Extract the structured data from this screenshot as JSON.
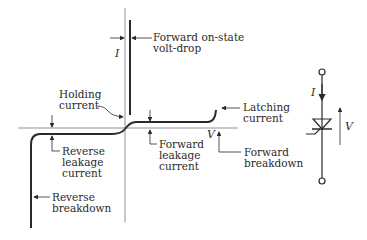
{
  "diagram": {
    "axes": {
      "current_label": "I",
      "voltage_label": "V"
    },
    "annotations": {
      "forward_on_state": [
        "Forward on-state",
        "volt-drop"
      ],
      "holding_current": [
        "Holding",
        "current"
      ],
      "latching_current": [
        "Latching",
        "current"
      ],
      "reverse_leakage": [
        "Reverse",
        "leakage",
        "current"
      ],
      "forward_leakage": [
        "Forward",
        "leakage",
        "current"
      ],
      "forward_breakdown": [
        "Forward",
        "breakdown"
      ],
      "reverse_breakdown": [
        "Reverse",
        "breakdown"
      ]
    },
    "symbol": {
      "name": "thyristor",
      "current_label": "I",
      "voltage_label": "V"
    },
    "colors": {
      "ink": "#2a2a2a",
      "axis": "#777777",
      "background": "#ffffff"
    }
  }
}
